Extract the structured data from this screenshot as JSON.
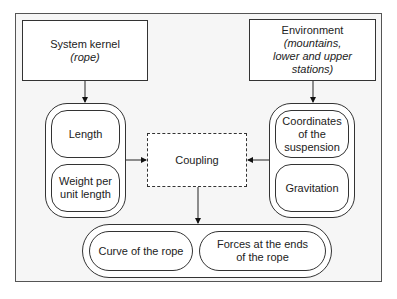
{
  "diagram": {
    "system_kernel": {
      "title": "System kernel",
      "subtitle": "(rope)"
    },
    "environment": {
      "title": "Environment",
      "subtitle_lines": [
        "(mountains,",
        "lower and upper",
        "stations)"
      ]
    },
    "left_group": {
      "items": [
        {
          "label": "Length"
        },
        {
          "label_lines": [
            "Weight per",
            "unit length"
          ]
        }
      ]
    },
    "right_group": {
      "items": [
        {
          "label_lines": [
            "Coordinates",
            "of the",
            "suspension"
          ]
        },
        {
          "label": "Gravitation"
        }
      ]
    },
    "coupling": {
      "label": "Coupling"
    },
    "output_group": {
      "items": [
        {
          "label": "Curve of the rope"
        },
        {
          "label_lines": [
            "Forces at the ends",
            "of the rope"
          ]
        }
      ]
    }
  }
}
